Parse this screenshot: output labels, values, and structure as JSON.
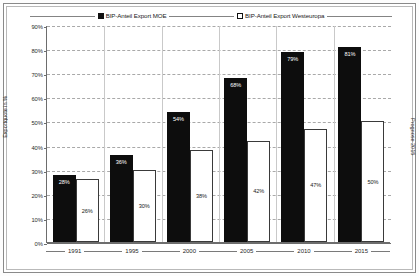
{
  "chart_data": {
    "type": "bar",
    "title": "",
    "xlabel": "",
    "ylabel": "Exportquote in %",
    "ylabel_right": "Prognose 2015",
    "ylim": [
      0,
      90
    ],
    "ytick_step": 10,
    "grid": true,
    "legend_position": "top",
    "categories": [
      "1991",
      "1995",
      "2000",
      "2005",
      "2010",
      "2015"
    ],
    "series": [
      {
        "name": "BIP-Anteil Export MOE",
        "color": "#0d0d0d",
        "style": "filled",
        "values": [
          28,
          36,
          54,
          68,
          79,
          81
        ],
        "labels": [
          "28%",
          "36%",
          "54%",
          "68%",
          "79%",
          "81%"
        ]
      },
      {
        "name": "BIP-Anteil Export Westeuropa",
        "color": "#ffffff",
        "style": "hollow",
        "values": [
          26,
          30,
          38,
          42,
          47,
          50
        ],
        "labels": [
          "26%",
          "30%",
          "38%",
          "42%",
          "47%",
          "50%"
        ]
      }
    ],
    "ytick_labels": [
      "90%",
      "80%",
      "70%",
      "60%",
      "50%",
      "40%",
      "30%",
      "20%",
      "10%",
      "0%"
    ],
    "ytick_values": [
      90,
      80,
      70,
      60,
      50,
      40,
      30,
      20,
      10,
      0
    ]
  },
  "legend": {
    "entries": [
      {
        "label": "BIP-Anteil Export MOE",
        "swatch": "filled-square-icon"
      },
      {
        "label": "BIP-Anteil Export Westeuropa",
        "swatch": "hollow-square-icon"
      }
    ]
  },
  "axes": {
    "y_title": "Exportquote in %",
    "y_title_right": "Prognose 2015"
  }
}
